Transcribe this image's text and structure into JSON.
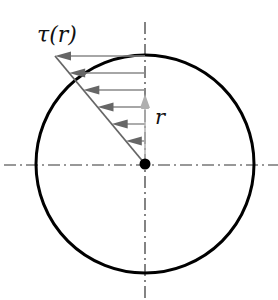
{
  "diagram": {
    "title_label": "τ(r)",
    "radius_label": "r",
    "center": {
      "x": 145,
      "y": 164
    },
    "circle_radius": 109,
    "axis_color": "#222222",
    "circle_color": "#000000",
    "arrow_color": "#777777",
    "radius_arrow_color": "#aaaaaa",
    "diagonal_color": "#666666",
    "stress_arrows_y": [
      56,
      73,
      90,
      107,
      124,
      141
    ]
  }
}
